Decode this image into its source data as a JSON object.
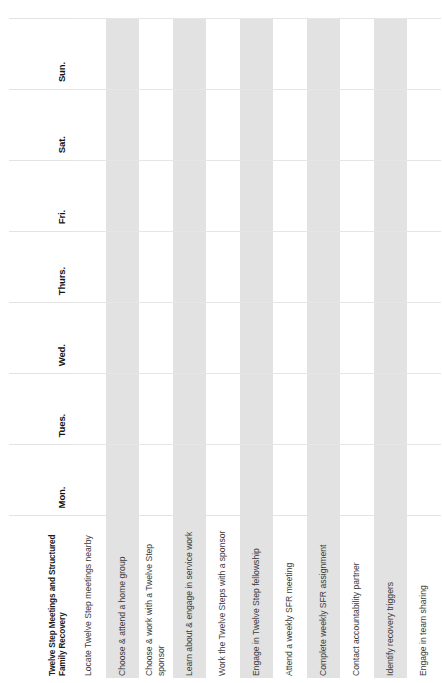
{
  "worksheet": {
    "title": "Twelve Step Meetings and Structured Family Recovery",
    "columns": [
      {
        "id": "task",
        "label": "Twelve Step Meetings and Structured Family Recovery"
      },
      {
        "id": "mon",
        "label": "Mon."
      },
      {
        "id": "tues",
        "label": "Tues."
      },
      {
        "id": "wed",
        "label": "Wed."
      },
      {
        "id": "thurs",
        "label": "Thurs."
      },
      {
        "id": "fri",
        "label": "Fri."
      },
      {
        "id": "sat",
        "label": "Sat."
      },
      {
        "id": "sun",
        "label": "Sun."
      }
    ],
    "day_labels": [
      "Mon.",
      "Tues.",
      "Wed.",
      "Thurs.",
      "Fri.",
      "Sat.",
      "Sun."
    ],
    "rows": [
      {
        "task": "Locate Twelve Step meetings nearby",
        "shaded": false,
        "checks": [
          "",
          "",
          "",
          "",
          "",
          "",
          ""
        ]
      },
      {
        "task": "Choose & attend a home group",
        "shaded": true,
        "checks": [
          "",
          "",
          "",
          "",
          "",
          "",
          ""
        ]
      },
      {
        "task": "Choose & work with a Twelve Step sponsor",
        "shaded": false,
        "checks": [
          "",
          "",
          "",
          "",
          "",
          "",
          ""
        ]
      },
      {
        "task": "Learn about & engage in service work",
        "shaded": true,
        "checks": [
          "",
          "",
          "",
          "",
          "",
          "",
          ""
        ]
      },
      {
        "task": "Work the Twelve Steps with a sponsor",
        "shaded": false,
        "checks": [
          "",
          "",
          "",
          "",
          "",
          "",
          ""
        ]
      },
      {
        "task": "Engage in Twelve Step fellowship",
        "shaded": true,
        "checks": [
          "",
          "",
          "",
          "",
          "",
          "",
          ""
        ]
      },
      {
        "task": "Attend a weekly SFR meeting",
        "shaded": false,
        "checks": [
          "",
          "",
          "",
          "",
          "",
          "",
          ""
        ]
      },
      {
        "task": "Complete weekly SFR assignment",
        "shaded": true,
        "checks": [
          "",
          "",
          "",
          "",
          "",
          "",
          ""
        ]
      },
      {
        "task": "Contact accountability partner",
        "shaded": false,
        "checks": [
          "",
          "",
          "",
          "",
          "",
          "",
          ""
        ]
      },
      {
        "task": "Identify recovery triggers",
        "shaded": true,
        "checks": [
          "",
          "",
          "",
          "",
          "",
          "",
          ""
        ]
      },
      {
        "task": "Engage in team sharing",
        "shaded": false,
        "checks": [
          "",
          "",
          "",
          "",
          "",
          "",
          ""
        ]
      }
    ],
    "colors": {
      "shaded_band": "#e2e2e2",
      "gridline": "#e6e6e6",
      "header_text": "#141414",
      "body_text": "#3a3a3a",
      "background": "#ffffff"
    }
  }
}
